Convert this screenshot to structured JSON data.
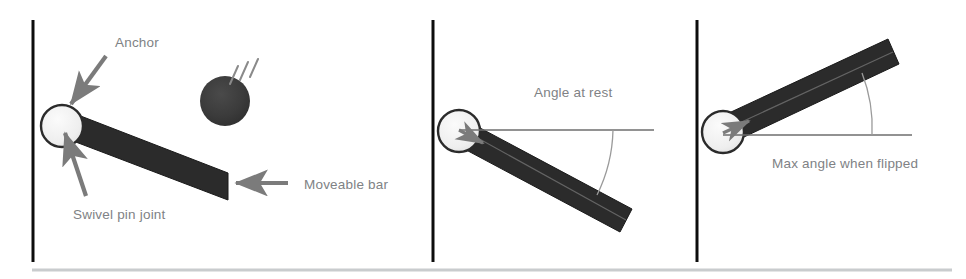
{
  "figure": {
    "background_color": "#ffffff",
    "panel_count": 3
  },
  "colors": {
    "wall": "#0d0d0d",
    "bar_fill": "#2b2b2b",
    "bar_stroke": "#1a1a1a",
    "pivot_fill": "#f2f2f2",
    "pivot_stroke": "#2b2b2b",
    "ball_fill": "#3a3a3a",
    "motion_line": "#8a8a8a",
    "arrow": "#7b7b7b",
    "label_text": "#808285",
    "reference_line": "#6e6e6e",
    "arc_line": "#9a9a9a",
    "footer_rule": "#c9ccce"
  },
  "panels": [
    {
      "id": "panel-anchor-overview",
      "name": "Anchor and moveable bar overview",
      "wall": {
        "label": "anchor-wall"
      },
      "pivot": {
        "label": "swivel-pin-joint"
      },
      "bar": {
        "label": "moveable-bar"
      },
      "ball": {
        "label": "impacting-ball"
      },
      "motion_lines": {
        "label": "ball-motion-lines",
        "count": 3
      },
      "labels": [
        {
          "key": "anchor",
          "text": "Anchor"
        },
        {
          "key": "swivel_pin_joint",
          "text": "Swivel pin joint"
        },
        {
          "key": "moveable_bar",
          "text": "Moveable bar"
        }
      ],
      "arrows": [
        {
          "key": "anchor_arrow",
          "points_to": "pivot-top"
        },
        {
          "key": "swivel_arrow",
          "points_to": "pivot-center"
        },
        {
          "key": "moveable_bar_arrow",
          "points_to": "bar-free-end"
        }
      ]
    },
    {
      "id": "panel-angle-at-rest",
      "name": "Angle at rest",
      "wall": {
        "label": "anchor-wall"
      },
      "pivot": {
        "label": "swivel-pin-joint"
      },
      "bar": {
        "label": "moveable-bar-resting"
      },
      "reference_line": {
        "label": "horizontal-reference-line"
      },
      "arc": {
        "label": "angle-arc-at-rest"
      },
      "labels": [
        {
          "key": "angle_at_rest",
          "text": "Angle at rest"
        }
      ]
    },
    {
      "id": "panel-max-angle-flipped",
      "name": "Max angle when flipped",
      "wall": {
        "label": "anchor-wall"
      },
      "pivot": {
        "label": "swivel-pin-joint"
      },
      "bar": {
        "label": "moveable-bar-flipped"
      },
      "reference_line": {
        "label": "horizontal-reference-line"
      },
      "arc": {
        "label": "angle-arc-max-flipped"
      },
      "labels": [
        {
          "key": "max_angle_when_flipped",
          "text": "Max angle when flipped"
        }
      ]
    }
  ],
  "footer": {
    "rule": {
      "label": "bottom-rule"
    }
  }
}
